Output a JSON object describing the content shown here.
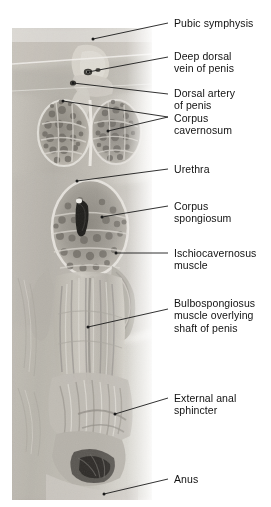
{
  "figure": {
    "kind": "anatomical-dissection-photograph",
    "orientation": "vertical-median-section",
    "region": "male perineum and root of penis",
    "photo_tone": "grayscale",
    "background_color": "#ffffff",
    "text_color": "#111111",
    "leader_color": "#1a1a1a"
  },
  "labels": [
    {
      "id": "pubic-symphysis",
      "text": "Pubic symphysis",
      "lines": [
        "Pubic symphysis"
      ],
      "text_x": 174,
      "text_y": 17,
      "leader": {
        "from_x": 93,
        "from_y": 39,
        "to_x": 168,
        "to_y": 23,
        "dot": true,
        "fork": false
      }
    },
    {
      "id": "deep-dorsal-vein-of-penis",
      "text": "Deep dorsal vein of penis",
      "lines": [
        "Deep dorsal",
        "vein of penis"
      ],
      "text_x": 174,
      "text_y": 50,
      "leader": {
        "from_x": 88,
        "from_y": 72,
        "to_x": 168,
        "to_y": 57,
        "dot": true,
        "fork": false
      }
    },
    {
      "id": "dorsal-artery-of-penis",
      "text": "Dorsal artery of penis",
      "lines": [
        "Dorsal artery",
        "of penis"
      ],
      "text_x": 174,
      "text_y": 87,
      "leader": {
        "from_x": 73,
        "from_y": 83,
        "to_x": 168,
        "to_y": 94,
        "dot": true,
        "fork": false
      }
    },
    {
      "id": "corpus-cavernosum",
      "text": "Corpus cavernosum",
      "lines": [
        "Corpus",
        "cavernosum"
      ],
      "text_x": 174,
      "text_y": 112,
      "leader": {
        "from_x": 105,
        "from_y": 103,
        "to_x": 168,
        "to_y": 117,
        "dot": true,
        "fork": true,
        "fork_a_x": 63,
        "fork_a_y": 101,
        "fork_b_x": 108,
        "fork_b_y": 131,
        "fork_join_x": 168,
        "fork_join_y": 117
      }
    },
    {
      "id": "urethra",
      "text": "Urethra",
      "lines": [
        "Urethra"
      ],
      "text_x": 174,
      "text_y": 163,
      "leader": {
        "from_x": 77,
        "from_y": 181,
        "to_x": 168,
        "to_y": 169,
        "dot": true,
        "fork": false
      }
    },
    {
      "id": "corpus-spongiosum",
      "text": "Corpus spongiosum",
      "lines": [
        "Corpus",
        "spongiosum"
      ],
      "text_x": 174,
      "text_y": 200,
      "leader": {
        "from_x": 102,
        "from_y": 217,
        "to_x": 168,
        "to_y": 206,
        "dot": true,
        "fork": false
      }
    },
    {
      "id": "ischiocavernosus-muscle",
      "text": "Ischiocavernosus muscle",
      "lines": [
        "Ischiocavernosus",
        "muscle"
      ],
      "text_x": 174,
      "text_y": 247,
      "leader": {
        "from_x": 116,
        "from_y": 253,
        "to_x": 168,
        "to_y": 253,
        "dot": true,
        "fork": false
      }
    },
    {
      "id": "bulbospongiosus-muscle",
      "text": "Bulbospongiosus muscle overlying shaft of penis",
      "lines": [
        "Bulbospongiosus",
        "muscle overlying",
        "shaft of penis"
      ],
      "text_x": 174,
      "text_y": 297,
      "leader": {
        "from_x": 88,
        "from_y": 327,
        "to_x": 168,
        "to_y": 309,
        "dot": true,
        "fork": false
      }
    },
    {
      "id": "external-anal-sphincter",
      "text": "External anal sphincter",
      "lines": [
        "External anal",
        "sphincter"
      ],
      "text_x": 174,
      "text_y": 392,
      "leader": {
        "from_x": 115,
        "from_y": 414,
        "to_x": 168,
        "to_y": 398,
        "dot": true,
        "fork": false
      }
    },
    {
      "id": "anus",
      "text": "Anus",
      "lines": [
        "Anus"
      ],
      "text_x": 174,
      "text_y": 473,
      "leader": {
        "from_x": 104,
        "from_y": 494,
        "to_x": 168,
        "to_y": 479,
        "dot": true,
        "fork": false
      }
    }
  ]
}
